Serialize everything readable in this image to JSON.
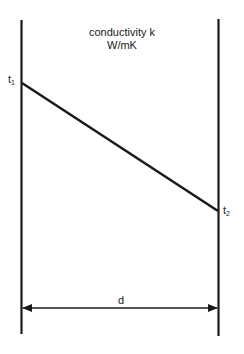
{
  "diagram": {
    "title_line1": "conductivity  k",
    "title_line2": "W/mK",
    "temp_left": "t",
    "temp_left_sub": "1",
    "temp_right": "t",
    "temp_right_sub": "2",
    "thickness_label": "d",
    "line_color": "#1a1a1a"
  }
}
